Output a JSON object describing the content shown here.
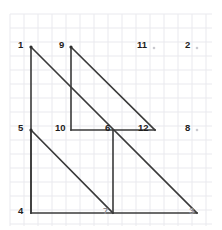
{
  "figure": {
    "background_color": "#ffffff",
    "grid_color": "#e9e9ee",
    "line_color": "#3a3a3a",
    "label_color": "#1d1d1d",
    "faint_label_color": "#8f8f96",
    "grid": {
      "x_start": 10,
      "y_start": 14,
      "x_end": 212,
      "y_end": 226,
      "spacing": 14
    },
    "vertices": [
      {
        "id": "v1",
        "label": "1",
        "x": 31,
        "y": 47,
        "label_x": 18,
        "label_y": 45,
        "dot": "large",
        "faint": false
      },
      {
        "id": "v9",
        "label": "9",
        "x": 71,
        "y": 47,
        "label_x": 59,
        "label_y": 45,
        "dot": "large",
        "faint": false
      },
      {
        "id": "v11",
        "label": "11",
        "x": 154,
        "y": 48,
        "label_x": 137,
        "label_y": 45,
        "dot": "small",
        "faint": false
      },
      {
        "id": "v2",
        "label": "2",
        "x": 197,
        "y": 48,
        "label_x": 185,
        "label_y": 45,
        "dot": "small",
        "faint": false
      },
      {
        "id": "v5",
        "label": "5",
        "x": 31,
        "y": 130,
        "label_x": 18,
        "label_y": 128,
        "dot": "large",
        "faint": false
      },
      {
        "id": "v10",
        "label": "10",
        "x": 71,
        "y": 130,
        "label_x": 55,
        "label_y": 128,
        "dot": "none",
        "faint": false
      },
      {
        "id": "v6",
        "label": "6",
        "x": 113,
        "y": 130,
        "label_x": 105,
        "label_y": 128,
        "dot": "none",
        "faint": false
      },
      {
        "id": "v12",
        "label": "12",
        "x": 155,
        "y": 130,
        "label_x": 138,
        "label_y": 128,
        "dot": "none",
        "faint": false
      },
      {
        "id": "v8",
        "label": "8",
        "x": 197,
        "y": 130,
        "label_x": 185,
        "label_y": 128,
        "dot": "small",
        "faint": false
      },
      {
        "id": "v4",
        "label": "4",
        "x": 31,
        "y": 213,
        "label_x": 18,
        "label_y": 211,
        "dot": "none",
        "faint": false
      },
      {
        "id": "v7",
        "label": "7",
        "x": 113,
        "y": 213,
        "label_x": 103,
        "label_y": 211,
        "dot": "none",
        "faint": true
      },
      {
        "id": "v3",
        "label": "3",
        "x": 197,
        "y": 213,
        "label_x": 189,
        "label_y": 211,
        "dot": "none",
        "faint": true
      }
    ],
    "segments": [
      {
        "id": "seg-1-4",
        "from": "v1",
        "to": "v4",
        "x1": 31,
        "y1": 47,
        "x2": 31,
        "y2": 213
      },
      {
        "id": "seg-1-3",
        "from": "v1",
        "to": "v3",
        "x1": 31,
        "y1": 47,
        "x2": 197,
        "y2": 213
      },
      {
        "id": "seg-4-3",
        "from": "v4",
        "to": "v3",
        "x1": 31,
        "y1": 213,
        "x2": 197,
        "y2": 213
      },
      {
        "id": "seg-9-10",
        "from": "v9",
        "to": "v10",
        "x1": 71,
        "y1": 47,
        "x2": 71,
        "y2": 130
      },
      {
        "id": "seg-9-12",
        "from": "v9",
        "to": "v12",
        "x1": 71,
        "y1": 47,
        "x2": 155,
        "y2": 130
      },
      {
        "id": "seg-10-12",
        "from": "v10",
        "to": "v12",
        "x1": 71,
        "y1": 130,
        "x2": 155,
        "y2": 130
      },
      {
        "id": "seg-5-4",
        "from": "v5",
        "to": "v4",
        "x1": 31,
        "y1": 130,
        "x2": 31,
        "y2": 213
      },
      {
        "id": "seg-5-7",
        "from": "v5",
        "to": "v7",
        "x1": 31,
        "y1": 130,
        "x2": 113,
        "y2": 213
      },
      {
        "id": "seg-6-7",
        "from": "v6",
        "to": "v7",
        "x1": 113,
        "y1": 130,
        "x2": 113,
        "y2": 213
      }
    ]
  }
}
